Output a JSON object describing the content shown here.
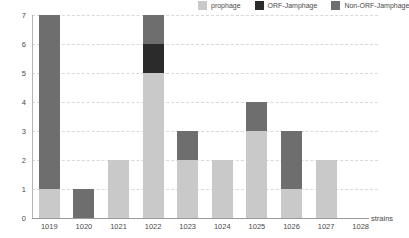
{
  "chart_data": {
    "type": "bar",
    "stacked": true,
    "title": "",
    "xlabel": "strains",
    "ylabel": "No. of prophage/jamphage",
    "categories": [
      "1019",
      "1020",
      "1021",
      "1022",
      "1023",
      "1024",
      "1025",
      "1026",
      "1027",
      "1028"
    ],
    "ylim": [
      0,
      7
    ],
    "yticks": [
      0,
      1,
      2,
      3,
      4,
      5,
      6,
      7
    ],
    "grid": "horizontal-dashed",
    "legend_position": "top-right",
    "series": [
      {
        "name": "prophage",
        "color": "#c9c9c9",
        "values": [
          1,
          0,
          2,
          5,
          2,
          2,
          3,
          1,
          2,
          0
        ]
      },
      {
        "name": "ORF-Jamphage",
        "color": "#2b2b2b",
        "values": [
          0,
          0,
          0,
          1,
          0,
          0,
          0,
          0,
          0,
          0
        ]
      },
      {
        "name": "Non-ORF-Jamphage",
        "color": "#6e6e6e",
        "values": [
          6,
          1,
          0,
          1,
          1,
          0,
          1,
          2,
          0,
          0
        ]
      }
    ],
    "totals": [
      7,
      1,
      2,
      7,
      3,
      2,
      4,
      3,
      2,
      0
    ]
  },
  "legend": {
    "items": [
      {
        "label": "prophage",
        "color": "#c9c9c9"
      },
      {
        "label": "ORF-Jamphage",
        "color": "#2b2b2b"
      },
      {
        "label": "Non-ORF-Jamphage",
        "color": "#6e6e6e"
      }
    ]
  },
  "axes": {
    "y_title": "No. of prophage/jamphage",
    "x_title": "strains"
  }
}
